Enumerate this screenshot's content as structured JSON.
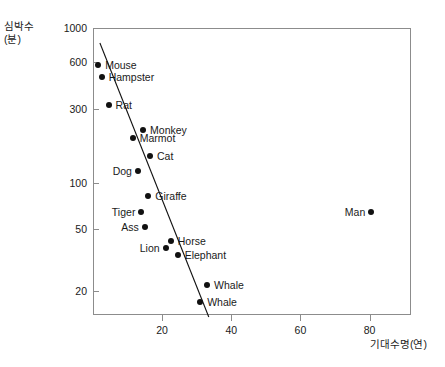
{
  "chart_data": {
    "type": "scatter",
    "title": "",
    "xlabel": "기대수명(연)",
    "ylabel": "심박수\n(분)",
    "ylabel_line1": "심박수",
    "ylabel_line2": "(분)",
    "yscale": "log",
    "xscale": "linear",
    "xlim": [
      0,
      92
    ],
    "ylim": [
      14,
      1000
    ],
    "grid": false,
    "legend": null,
    "xticks": [
      20,
      40,
      60,
      80
    ],
    "xtick_labels": [
      "20",
      "40",
      "60",
      "80"
    ],
    "yticks": [
      1000,
      600,
      300,
      100,
      50,
      20
    ],
    "ytick_labels": [
      "1000",
      "600",
      "300",
      "100",
      "50",
      "20"
    ],
    "points": [
      {
        "label": "Mouse",
        "x": 1.5,
        "y": 580,
        "label_side": "right"
      },
      {
        "label": "Hampster",
        "x": 2.5,
        "y": 480,
        "label_side": "right"
      },
      {
        "label": "Rat",
        "x": 4.5,
        "y": 320,
        "label_side": "right"
      },
      {
        "label": "Monkey",
        "x": 14.5,
        "y": 220,
        "label_side": "right"
      },
      {
        "label": "Marmot",
        "x": 11.5,
        "y": 195,
        "label_side": "right"
      },
      {
        "label": "Cat",
        "x": 16.5,
        "y": 148,
        "label_side": "right"
      },
      {
        "label": "Dog",
        "x": 13.0,
        "y": 120,
        "label_side": "left"
      },
      {
        "label": "Giraffe",
        "x": 16.0,
        "y": 82,
        "label_side": "right"
      },
      {
        "label": "Tiger",
        "x": 14.0,
        "y": 65,
        "label_side": "left"
      },
      {
        "label": "Ass",
        "x": 15.0,
        "y": 52,
        "label_side": "left"
      },
      {
        "label": "Horse",
        "x": 22.5,
        "y": 42,
        "label_side": "right"
      },
      {
        "label": "Lion",
        "x": 21.0,
        "y": 38,
        "label_side": "left"
      },
      {
        "label": "Elephant",
        "x": 24.5,
        "y": 34,
        "label_side": "right"
      },
      {
        "label": "Whale",
        "x": 33.0,
        "y": 22,
        "label_side": "right"
      },
      {
        "label": "Whale",
        "x": 31.0,
        "y": 17,
        "label_side": "right"
      },
      {
        "label": "Man",
        "x": 80.5,
        "y": 65,
        "label_side": "left"
      }
    ],
    "trend_line": {
      "x_start": 2.0,
      "y_start": 800,
      "x_end": 33.5,
      "y_end": 13.6
    }
  }
}
